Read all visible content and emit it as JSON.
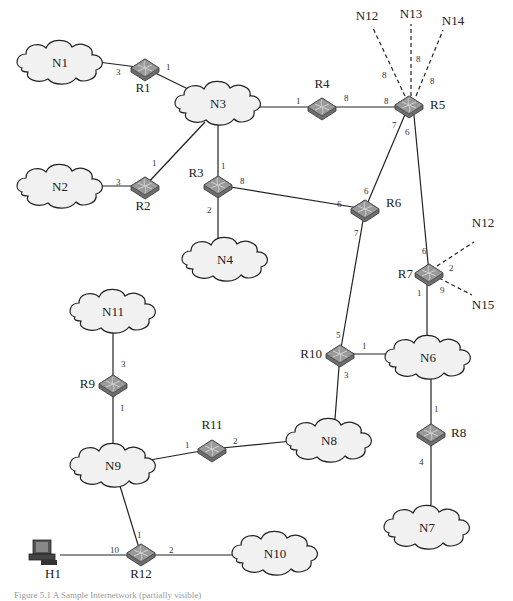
{
  "diagram": {
    "type": "network-topology",
    "caption": "Figure 5.1 A Sample Internetwork (partially visible)",
    "networks": [
      {
        "id": "N1",
        "x": 60,
        "y": 62
      },
      {
        "id": "N2",
        "x": 60,
        "y": 186
      },
      {
        "id": "N3",
        "x": 218,
        "y": 103
      },
      {
        "id": "N4",
        "x": 225,
        "y": 259
      },
      {
        "id": "N6",
        "x": 428,
        "y": 357
      },
      {
        "id": "N7",
        "x": 427,
        "y": 527
      },
      {
        "id": "N8",
        "x": 329,
        "y": 440
      },
      {
        "id": "N9",
        "x": 113,
        "y": 465
      },
      {
        "id": "N10",
        "x": 275,
        "y": 553
      },
      {
        "id": "N11",
        "x": 113,
        "y": 311
      }
    ],
    "routers": [
      {
        "id": "R1",
        "x": 145,
        "y": 68,
        "lx": 143,
        "ly": 92
      },
      {
        "id": "R2",
        "x": 145,
        "y": 186,
        "lx": 143,
        "ly": 210
      },
      {
        "id": "R3",
        "x": 218,
        "y": 185,
        "lx": 196,
        "ly": 177
      },
      {
        "id": "R4",
        "x": 322,
        "y": 107,
        "lx": 322,
        "ly": 88
      },
      {
        "id": "R5",
        "x": 409,
        "y": 105,
        "lx": 436,
        "ly": 108
      },
      {
        "id": "R6",
        "x": 365,
        "y": 209,
        "lx": 392,
        "ly": 206
      },
      {
        "id": "R7",
        "x": 429,
        "y": 273,
        "lx": 409,
        "ly": 278
      },
      {
        "id": "R8",
        "x": 431,
        "y": 433,
        "lx": 456,
        "ly": 437
      },
      {
        "id": "R9",
        "x": 113,
        "y": 384,
        "lx": 86,
        "ly": 388
      },
      {
        "id": "R10",
        "x": 340,
        "y": 354,
        "lx": 304,
        "ly": 358
      },
      {
        "id": "R11",
        "x": 212,
        "y": 449,
        "lx": 212,
        "ly": 429
      },
      {
        "id": "R12",
        "x": 141,
        "y": 551,
        "lx": 141,
        "ly": 578
      }
    ],
    "hosts": [
      {
        "id": "H1",
        "x": 45,
        "y": 552,
        "lx": 53,
        "ly": 578
      }
    ],
    "links": [
      {
        "from": "N1",
        "to": "R1",
        "port": "3",
        "style": "solid"
      },
      {
        "from": "R1",
        "to": "N3",
        "port": "1",
        "style": "solid"
      },
      {
        "from": "N2",
        "to": "R2",
        "port": "3",
        "style": "solid"
      },
      {
        "from": "R2",
        "to": "N3",
        "port": "1",
        "style": "solid"
      },
      {
        "from": "N3",
        "to": "R3",
        "port": "1",
        "style": "solid"
      },
      {
        "from": "R3",
        "to": "N4",
        "port": "2",
        "style": "solid"
      },
      {
        "from": "R3",
        "to": "R6",
        "ports": [
          "8",
          "6"
        ],
        "style": "solid"
      },
      {
        "from": "N3",
        "to": "R4",
        "port": "1",
        "style": "solid"
      },
      {
        "from": "R4",
        "to": "R5",
        "ports": [
          "8",
          "8"
        ],
        "style": "solid"
      },
      {
        "from": "R5",
        "to": "N12",
        "port": "8",
        "style": "dashed"
      },
      {
        "from": "R5",
        "to": "N13",
        "port": "8",
        "style": "dashed"
      },
      {
        "from": "R5",
        "to": "N14",
        "port": "8",
        "style": "dashed"
      },
      {
        "from": "R5",
        "to": "R6",
        "ports": [
          "7",
          "6"
        ],
        "style": "solid"
      },
      {
        "from": "R5",
        "to": "R7",
        "ports": [
          "6",
          "6"
        ],
        "style": "solid"
      },
      {
        "from": "R6",
        "to": "R10",
        "ports": [
          "7",
          "5"
        ],
        "style": "solid"
      },
      {
        "from": "R7",
        "to": "N12",
        "port": "2",
        "style": "dashed"
      },
      {
        "from": "R7",
        "to": "N15",
        "port": "9",
        "style": "dashed"
      },
      {
        "from": "R7",
        "to": "N6",
        "port": "1",
        "style": "solid"
      },
      {
        "from": "R10",
        "to": "N6",
        "port": "1",
        "style": "solid"
      },
      {
        "from": "R10",
        "to": "N8",
        "port": "3",
        "style": "solid"
      },
      {
        "from": "N6",
        "to": "R8",
        "port": "1",
        "style": "solid"
      },
      {
        "from": "R8",
        "to": "N7",
        "port": "4",
        "style": "solid"
      },
      {
        "from": "N11",
        "to": "R9",
        "port": "3",
        "style": "solid"
      },
      {
        "from": "R9",
        "to": "N9",
        "port": "1",
        "style": "solid"
      },
      {
        "from": "N9",
        "to": "R11",
        "port": "1",
        "style": "solid"
      },
      {
        "from": "R11",
        "to": "N8",
        "port": "2",
        "style": "solid"
      },
      {
        "from": "N9",
        "to": "R12",
        "port": "1",
        "style": "solid"
      },
      {
        "from": "H1",
        "to": "R12",
        "port": "10",
        "style": "solid"
      },
      {
        "from": "R12",
        "to": "N10",
        "port": "2",
        "style": "solid"
      }
    ],
    "external_labels": [
      {
        "id": "N12",
        "x": 367,
        "y": 19
      },
      {
        "id": "N13",
        "x": 411,
        "y": 17
      },
      {
        "id": "N14",
        "x": 453,
        "y": 24
      },
      {
        "id": "N12",
        "x": 483,
        "y": 224,
        "note": "R7 side"
      },
      {
        "id": "N15",
        "x": 483,
        "y": 306
      }
    ],
    "port_labels": [
      {
        "text": "3",
        "x": 116,
        "y": 72
      },
      {
        "text": "1",
        "x": 169,
        "y": 70
      },
      {
        "text": "3",
        "x": 119,
        "y": 182
      },
      {
        "text": "1",
        "x": 154,
        "y": 162
      },
      {
        "text": "1",
        "x": 223,
        "y": 165
      },
      {
        "text": "8",
        "x": 243,
        "y": 181
      },
      {
        "text": "2",
        "x": 210,
        "y": 210
      },
      {
        "text": "1",
        "x": 297,
        "y": 102
      },
      {
        "text": "8",
        "x": 346,
        "y": 100
      },
      {
        "text": "8",
        "x": 385,
        "y": 102
      },
      {
        "text": "8",
        "x": 384,
        "y": 77
      },
      {
        "text": "8",
        "x": 418,
        "y": 61
      },
      {
        "text": "8",
        "x": 433,
        "y": 83
      },
      {
        "text": "7",
        "x": 394,
        "y": 127
      },
      {
        "text": "6",
        "x": 407,
        "y": 134
      },
      {
        "text": "6",
        "x": 366,
        "y": 192
      },
      {
        "text": "6",
        "x": 339,
        "y": 205
      },
      {
        "text": "7",
        "x": 356,
        "y": 234
      },
      {
        "text": "6",
        "x": 424,
        "y": 253
      },
      {
        "text": "2",
        "x": 451,
        "y": 270
      },
      {
        "text": "9",
        "x": 442,
        "y": 292
      },
      {
        "text": "1",
        "x": 419,
        "y": 295
      },
      {
        "text": "5",
        "x": 338,
        "y": 337
      },
      {
        "text": "1",
        "x": 364,
        "y": 348
      },
      {
        "text": "3",
        "x": 346,
        "y": 377
      },
      {
        "text": "1",
        "x": 436,
        "y": 411
      },
      {
        "text": "4",
        "x": 421,
        "y": 464
      },
      {
        "text": "3",
        "x": 123,
        "y": 366
      },
      {
        "text": "1",
        "x": 122,
        "y": 410
      },
      {
        "text": "1",
        "x": 187,
        "y": 447
      },
      {
        "text": "2",
        "x": 235,
        "y": 443
      },
      {
        "text": "1",
        "x": 139,
        "y": 537
      },
      {
        "text": "10",
        "x": 114,
        "y": 552
      },
      {
        "text": "2",
        "x": 171,
        "y": 552
      }
    ]
  }
}
